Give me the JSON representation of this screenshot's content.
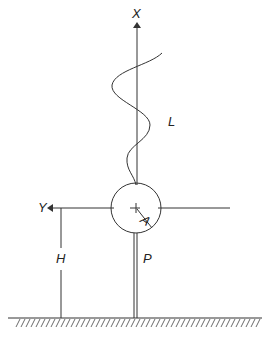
{
  "diagram": {
    "type": "engineering-sketch",
    "labels": {
      "x_axis": "X",
      "y_axis": "Y",
      "length": "L",
      "point": "A",
      "height": "H",
      "post": "P"
    },
    "colors": {
      "line": "#333333",
      "background": "#ffffff"
    }
  }
}
